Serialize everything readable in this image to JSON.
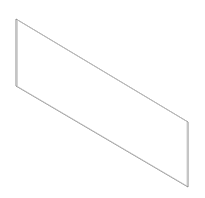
{
  "figure": {
    "type": "isometric-line-drawing",
    "colors": {
      "background": "#ffffff",
      "stroke": "#8a8a8a",
      "inner_stroke": "#c4c4c4"
    },
    "outline": {
      "top_left": [
        16,
        19
      ],
      "bottom_left": [
        16,
        86
      ],
      "bottom_right": [
        188,
        187
      ],
      "top_right": [
        188,
        122
      ]
    }
  }
}
